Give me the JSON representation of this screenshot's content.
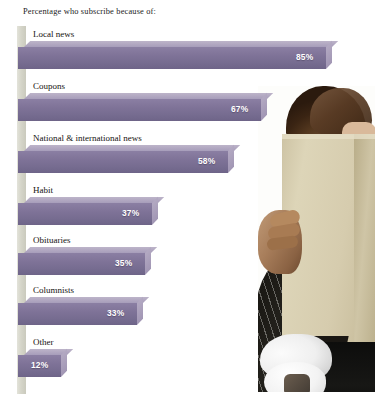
{
  "chart_data": {
    "type": "bar",
    "orientation": "horizontal",
    "title": "Percentage who subscribe because of:",
    "xlabel": "",
    "ylabel": "",
    "xlim": [
      0,
      100
    ],
    "grid": false,
    "legend": "none",
    "value_suffix": "%",
    "categories": [
      "Local news",
      "Coupons",
      "National & international news",
      "Habit",
      "Obituaries",
      "Columnists",
      "Other"
    ],
    "values": [
      85,
      67,
      58,
      37,
      35,
      33,
      12
    ],
    "labels": [
      "85%",
      "67%",
      "58%",
      "37%",
      "35%",
      "33%",
      "12%"
    ],
    "series": [
      {
        "name": "Percentage who subscribe",
        "values": [
          85,
          67,
          58,
          37,
          35,
          33,
          12
        ]
      }
    ]
  },
  "colors": {
    "bar_face": "#7f7398",
    "bar_top": "#b1a7c1",
    "bar_cap": "#a89dba",
    "axis_band": "#d5d5c9",
    "label_text": "#15130f",
    "value_text": "#ffffff",
    "background": "#ffffff"
  },
  "photo": {
    "description": "person-holding-newspaper"
  }
}
